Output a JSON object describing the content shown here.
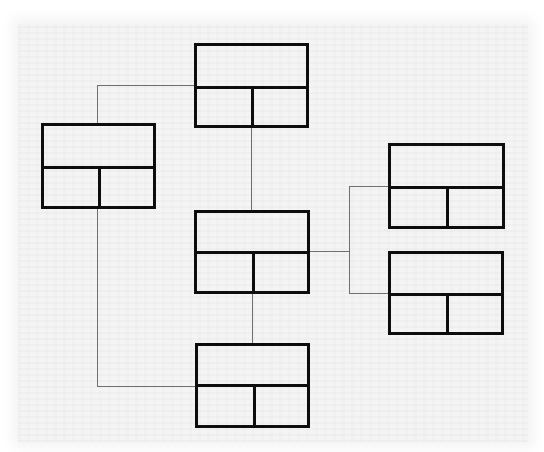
{
  "diagram": {
    "title": "",
    "colors": {
      "box_stroke": "#0d0d0d",
      "connector": "#6e6e6e",
      "background": "#f4f4f4"
    },
    "nodes": [
      {
        "id": "top",
        "header": "",
        "cells": [
          "",
          ""
        ]
      },
      {
        "id": "left",
        "header": "",
        "cells": [
          "",
          ""
        ]
      },
      {
        "id": "center",
        "header": "",
        "cells": [
          "",
          ""
        ]
      },
      {
        "id": "right-top",
        "header": "",
        "cells": [
          "",
          ""
        ]
      },
      {
        "id": "right-bottom",
        "header": "",
        "cells": [
          "",
          ""
        ]
      },
      {
        "id": "bottom",
        "header": "",
        "cells": [
          "",
          ""
        ]
      }
    ],
    "edges": [
      {
        "from": "top",
        "to": "left"
      },
      {
        "from": "top",
        "to": "center"
      },
      {
        "from": "left",
        "to": "bottom"
      },
      {
        "from": "center",
        "to": "bottom"
      },
      {
        "from": "center",
        "to": "right-top"
      },
      {
        "from": "center",
        "to": "right-bottom"
      }
    ]
  }
}
